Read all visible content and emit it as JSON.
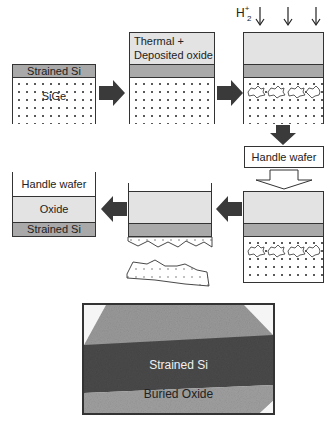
{
  "step1": {
    "strained_si": "Strained Si",
    "substrate": "SiGe"
  },
  "step2": {
    "oxide_label_line1": "Thermal +",
    "oxide_label_line2": "Deposited oxide"
  },
  "step3": {
    "implant_label": "H",
    "implant_sub": "2",
    "implant_sup": "+"
  },
  "step4": {
    "handle_wafer": "Handle wafer"
  },
  "step6": {
    "handle_wafer": "Handle wafer",
    "oxide": "Oxide",
    "strained_si": "Strained Si"
  },
  "tem_image": {
    "strained_si": "Strained Si",
    "buried_oxide": "Buried Oxide"
  },
  "colors": {
    "oxide": "#e3e3e3",
    "strained_si": "#a9a9a9",
    "arrow": "#3a3a3a",
    "tem_dark": "#4a4a4a",
    "tem_light": "#9a9a9a"
  }
}
